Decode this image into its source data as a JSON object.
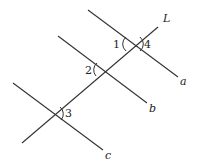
{
  "diagram": {
    "lines": {
      "L": {
        "label": "L"
      },
      "a": {
        "label": "a"
      },
      "b": {
        "label": "b"
      },
      "c": {
        "label": "c"
      }
    },
    "angles": {
      "angle1": "1",
      "angle2": "2",
      "angle3": "3",
      "angle4": "4"
    },
    "colors": {
      "stroke": "#333333",
      "background": "#ffffff"
    }
  }
}
